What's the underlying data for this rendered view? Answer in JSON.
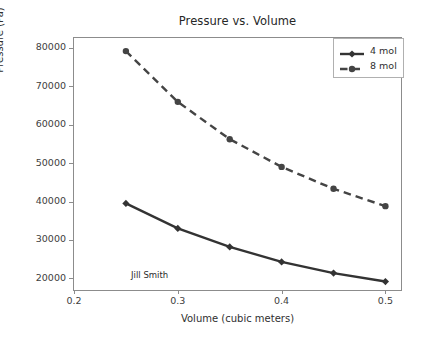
{
  "chart_data": {
    "type": "line",
    "title": "Pressure vs. Volume",
    "xlabel": "Volume (cubic meters)",
    "ylabel": "Pressure (Pa)",
    "xlim": [
      0.2,
      0.515
    ],
    "ylim": [
      17000,
      82500
    ],
    "grid": false,
    "legend_position": "upper right",
    "xticks": [
      0.2,
      0.3,
      0.4,
      0.5
    ],
    "xtick_labels": [
      "0.2",
      "0.3",
      "0.4",
      "0.5"
    ],
    "yticks": [
      20000,
      30000,
      40000,
      50000,
      60000,
      70000,
      80000
    ],
    "ytick_labels": [
      "20000",
      "30000",
      "40000",
      "50000",
      "60000",
      "70000",
      "80000"
    ],
    "x": [
      0.25,
      0.3,
      0.35,
      0.4,
      0.45,
      0.5
    ],
    "series": [
      {
        "name": "4 mol",
        "values": [
          39500,
          33000,
          28200,
          24300,
          21400,
          19200
        ],
        "color": "#333333",
        "linestyle": "solid",
        "marker": "diamond"
      },
      {
        "name": "8 mol",
        "values": [
          79100,
          65900,
          56200,
          49000,
          43300,
          38800
        ],
        "color": "#444444",
        "linestyle": "dashed",
        "marker": "circle"
      }
    ],
    "annotations": [
      {
        "text": "Jill Smith",
        "x": 0.255,
        "y": 20700
      }
    ]
  }
}
